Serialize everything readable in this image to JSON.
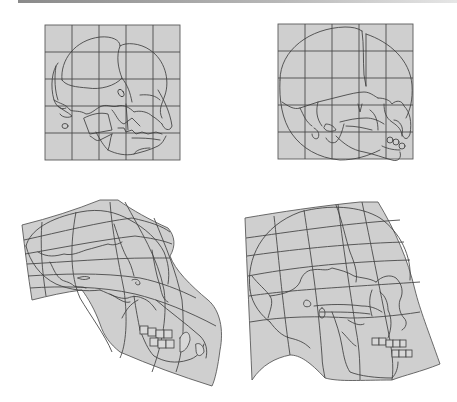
{
  "figure": {
    "background": "#ffffff",
    "grid_fill": "#cfcfcf",
    "line_color": "#3e3e3e",
    "panels": [
      {
        "id": "juvenile-chimp",
        "position": "top-left",
        "grid": "regular 5x5",
        "facing": "right"
      },
      {
        "id": "juvenile-human",
        "position": "top-right",
        "grid": "regular 5x5",
        "facing": "right"
      },
      {
        "id": "adult-chimp",
        "position": "bottom-left",
        "grid": "deformed",
        "facing": "right"
      },
      {
        "id": "adult-human",
        "position": "bottom-right",
        "grid": "deformed",
        "facing": "right"
      }
    ]
  }
}
